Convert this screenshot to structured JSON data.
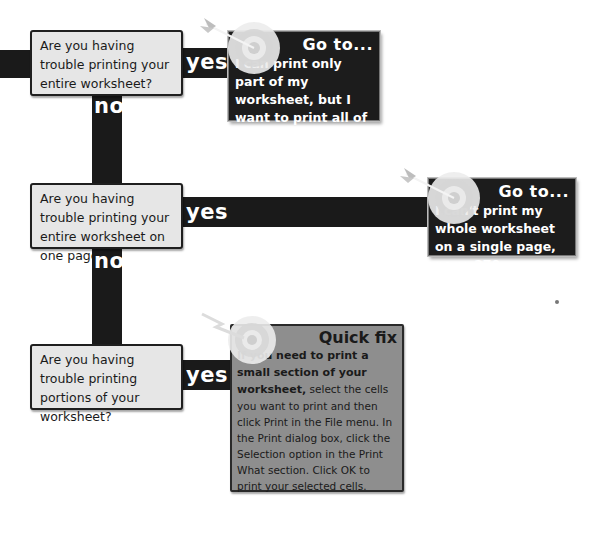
{
  "flowchart": {
    "nodes": [
      {
        "question": "Are you having trouble printing your entire worksheet?",
        "yes_label": "yes",
        "no_label": "no",
        "result": {
          "kind": "goto",
          "title": "Go to...",
          "text": "I can print only part of my worksheet, but I want to print all of it, page 272."
        }
      },
      {
        "question": "Are you having trouble printing your entire worksheet on one page?",
        "yes_label": "yes",
        "no_label": "no",
        "result": {
          "kind": "goto",
          "title": "Go to...",
          "text": "I can't print my whole worksheet on a single page, page 270."
        }
      },
      {
        "question": "Are you having trouble printing portions of your worksheet?",
        "yes_label": "yes",
        "result": {
          "kind": "quickfix",
          "title": "Quick fix",
          "lead": "If you need to print a small section of your worksheet,",
          "text": " select the cells you want to print and then click Print in the File menu. In the Print dialog box, click the Selection option in the Print What section. Click OK to print your selected cells."
        }
      }
    ]
  },
  "colors": {
    "connector": "#1a1a1a",
    "question_box": "#e6e6e6",
    "goto_box": "#1c1c1c",
    "quickfix_box": "#8e8e8e"
  },
  "icons": {
    "target_icon": "target-with-arrow",
    "bolt_icon": "lightning-target"
  }
}
